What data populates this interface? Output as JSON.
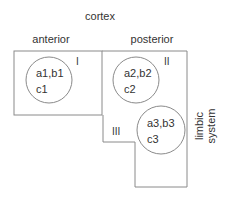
{
  "title": "cortex",
  "regions": {
    "anterior": {
      "label": "anterior"
    },
    "posterior": {
      "label": "posterior"
    },
    "limbic": {
      "label_line1": "limbic",
      "label_line2": "system"
    }
  },
  "zones": [
    {
      "numeral": "I",
      "line1": "a1,b1",
      "line2": "c1"
    },
    {
      "numeral": "II",
      "line1": "a2,b2",
      "line2": "c2"
    },
    {
      "numeral": "III",
      "line1": "a3,b3",
      "line2": "c3"
    }
  ],
  "colors": {
    "line": "#8a8a8a",
    "text": "#333333",
    "background": "#ffffff"
  }
}
